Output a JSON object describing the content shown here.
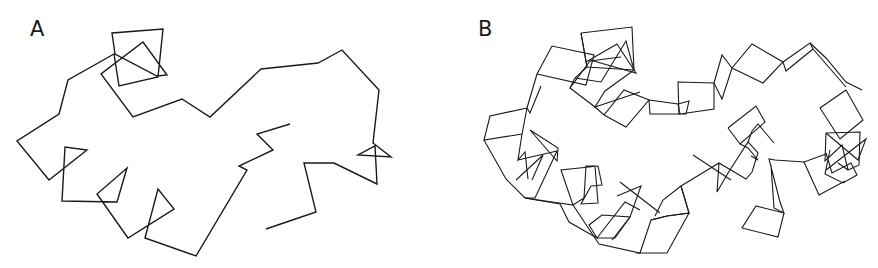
{
  "figure": {
    "panels": [
      {
        "label": "A",
        "description": "C-alpha backbone trace",
        "trace_points": [
          [
            290,
            124
          ],
          [
            257,
            134
          ],
          [
            273,
            150
          ],
          [
            239,
            166
          ],
          [
            247,
            170
          ],
          [
            196,
            256
          ],
          [
            145,
            238
          ],
          [
            158,
            189
          ],
          [
            174,
            209
          ],
          [
            128,
            238
          ],
          [
            97,
            194
          ],
          [
            127,
            168
          ],
          [
            117,
            202
          ],
          [
            62,
            201
          ],
          [
            65,
            147
          ],
          [
            87,
            150
          ],
          [
            49,
            180
          ],
          [
            17,
            141
          ],
          [
            59,
            114
          ],
          [
            68,
            80
          ],
          [
            114,
            54
          ],
          [
            119,
            86
          ],
          [
            158,
            77
          ],
          [
            163,
            29
          ],
          [
            112,
            33
          ],
          [
            115,
            54
          ],
          [
            157,
            76
          ],
          [
            167,
            75
          ],
          [
            143,
            42
          ],
          [
            101,
            74
          ],
          [
            133,
            117
          ],
          [
            182,
            99
          ],
          [
            210,
            117
          ],
          [
            261,
            69
          ],
          [
            318,
            63
          ],
          [
            342,
            50
          ],
          [
            379,
            90
          ],
          [
            373,
            143
          ],
          [
            391,
            157
          ],
          [
            358,
            155
          ],
          [
            375,
            146
          ],
          [
            377,
            184
          ],
          [
            334,
            163
          ],
          [
            304,
            163
          ],
          [
            316,
            212
          ],
          [
            266,
            229
          ]
        ]
      },
      {
        "label": "B",
        "description": "Peptide-plane ribbon representation"
      }
    ]
  }
}
